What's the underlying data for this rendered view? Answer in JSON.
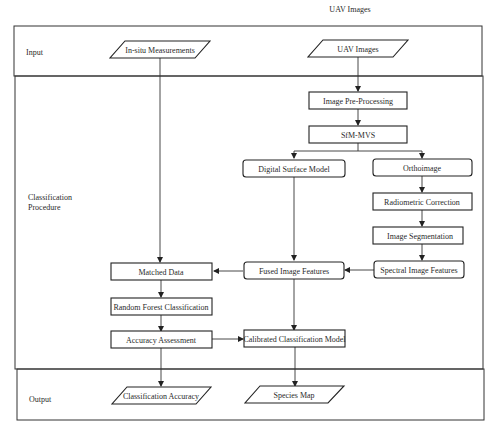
{
  "caption": "UAV Images",
  "lanes": [
    {
      "id": "input",
      "label": "Input"
    },
    {
      "id": "classification",
      "label": "Classification Procedure",
      "label_lines": [
        "Classification",
        "Procedure"
      ]
    },
    {
      "id": "output",
      "label": "Output"
    }
  ],
  "nodes": {
    "insitu": {
      "label": "In-situ Measurements",
      "shape": "parallelogram"
    },
    "uav": {
      "label": "UAV Images",
      "shape": "parallelogram"
    },
    "preproc": {
      "label": "Image Pre-Processing",
      "shape": "rect"
    },
    "sfm": {
      "label": "SfM-MVS",
      "shape": "rect"
    },
    "dsm": {
      "label": "Digital Surface Model",
      "shape": "rounded"
    },
    "ortho": {
      "label": "Orthoimage",
      "shape": "rounded"
    },
    "radio": {
      "label": "Radiometric Correction",
      "shape": "rect"
    },
    "seg": {
      "label": "Image Segmentation",
      "shape": "rect"
    },
    "spectral": {
      "label": "Spectral Image Features",
      "shape": "rounded"
    },
    "fused": {
      "label": "Fused Image Features",
      "shape": "rounded"
    },
    "matched": {
      "label": "Matched Data",
      "shape": "rect"
    },
    "rf": {
      "label": "Random Forest Classification",
      "shape": "rect"
    },
    "acc": {
      "label": "Accuracy Assessment",
      "shape": "rect"
    },
    "calib": {
      "label": "Calibrated Classification Model",
      "shape": "rect"
    },
    "classacc": {
      "label": "Classification Accuracy",
      "shape": "parallelogram"
    },
    "species": {
      "label": "Species Map",
      "shape": "parallelogram"
    }
  },
  "edges": [
    {
      "from": "uav",
      "to": "preproc"
    },
    {
      "from": "preproc",
      "to": "sfm"
    },
    {
      "from": "sfm",
      "to": "dsm"
    },
    {
      "from": "sfm",
      "to": "ortho"
    },
    {
      "from": "ortho",
      "to": "radio"
    },
    {
      "from": "radio",
      "to": "seg"
    },
    {
      "from": "seg",
      "to": "spectral"
    },
    {
      "from": "spectral",
      "to": "fused"
    },
    {
      "from": "dsm",
      "to": "fused"
    },
    {
      "from": "fused",
      "to": "matched"
    },
    {
      "from": "insitu",
      "to": "matched"
    },
    {
      "from": "matched",
      "to": "rf"
    },
    {
      "from": "rf",
      "to": "acc"
    },
    {
      "from": "acc",
      "to": "calib"
    },
    {
      "from": "fused",
      "to": "calib"
    },
    {
      "from": "acc",
      "to": "classacc"
    },
    {
      "from": "calib",
      "to": "species"
    }
  ]
}
